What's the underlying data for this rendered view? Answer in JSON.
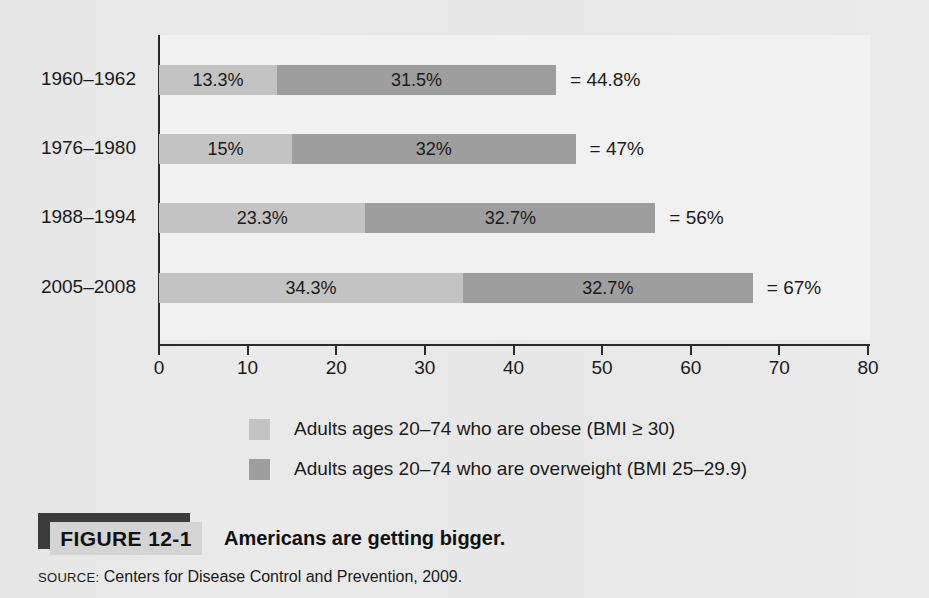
{
  "figure": {
    "tag_label": "FIGURE 12-1",
    "title": "Americans are getting bigger.",
    "source_keyword": "SOURCE:",
    "source_text": " Centers for Disease Control and Prevention, 2009."
  },
  "colors": {
    "obese": "#c3c3c3",
    "overweight": "#9e9e9e",
    "page_background": "#e8e8e8",
    "plot_background": "#f1f1f1",
    "axis": "#2a2a2a",
    "caption_shadow": "#3b3b3b",
    "caption_box": "#d4d4d4"
  },
  "legend": {
    "items": [
      {
        "swatch": "obese-swatch",
        "label": "Adults ages 20–74 who are obese (BMI ≥ 30)"
      },
      {
        "swatch": "overweight-swatch",
        "label": "Adults ages 20–74 who are overweight (BMI 25–29.9)"
      }
    ]
  },
  "chart_data": {
    "type": "bar",
    "orientation": "horizontal",
    "stacked": true,
    "title": "Americans are getting bigger.",
    "xlabel": "",
    "ylabel": "",
    "xlim": [
      0,
      80
    ],
    "xticks": [
      0,
      10,
      20,
      30,
      40,
      50,
      60,
      70,
      80
    ],
    "xtick_labels": [
      "0",
      "10",
      "20",
      "30",
      "40",
      "50",
      "60",
      "70",
      "80"
    ],
    "grid": false,
    "legend_position": "bottom",
    "categories": [
      "1960–1962",
      "1976–1980",
      "1988–1994",
      "2005–2008"
    ],
    "series": [
      {
        "name": "Adults ages 20–74 who are obese (BMI ≥ 30)",
        "color": "#c3c3c3",
        "values": [
          13.3,
          15,
          23.3,
          34.3
        ],
        "labels": [
          "13.3%",
          "15%",
          "23.3%",
          "34.3%"
        ]
      },
      {
        "name": "Adults ages 20–74 who are overweight (BMI 25–29.9)",
        "color": "#9e9e9e",
        "values": [
          31.5,
          32,
          32.7,
          32.7
        ],
        "labels": [
          "31.5%",
          "32%",
          "32.7%",
          "32.7%"
        ]
      }
    ],
    "totals": [
      44.8,
      47,
      56,
      67
    ],
    "total_labels": [
      "= 44.8%",
      "= 47%",
      "= 56%",
      "= 67%"
    ]
  }
}
